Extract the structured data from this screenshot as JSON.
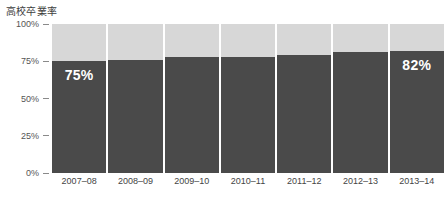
{
  "chart_data": {
    "type": "bar",
    "title": "高校卒業率",
    "xlabel": "",
    "ylabel": "",
    "ylim": [
      0,
      100
    ],
    "grid": false,
    "legend": "none",
    "stacked_remainder_color": "#d7d7d7",
    "bar_color": "#4a4a4a",
    "categories": [
      "2007–08",
      "2008–09",
      "2009–10",
      "2010–11",
      "2011–12",
      "2012–13",
      "2013–14"
    ],
    "values": [
      75,
      76,
      78,
      78,
      79,
      81,
      82
    ],
    "ytick_labels": [
      "100%",
      "75%",
      "50%",
      "25%",
      "0%"
    ],
    "ytick_values": [
      100,
      75,
      50,
      25,
      0
    ],
    "point_labels": [
      "75%",
      "",
      "",
      "",
      "",
      "",
      "82%"
    ]
  },
  "colors": {
    "bar": "#4a4a4a",
    "remainder": "#d7d7d7",
    "title": "#3d3d3d",
    "axis_text": "#555555",
    "background": "#ffffff"
  }
}
